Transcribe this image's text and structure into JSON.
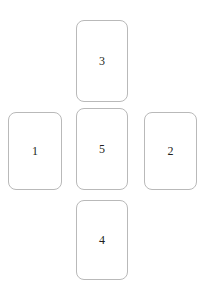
{
  "diagram": {
    "type": "card-spread",
    "layout": "cross",
    "background_color": "#ffffff",
    "card": {
      "fill_color": "#ffffff",
      "border_color": "#b9b9b9",
      "border_radius_px": 8,
      "number_color": "#231f20"
    },
    "cards": [
      {
        "label": "3",
        "position": "top",
        "x": 76,
        "y": 20,
        "width": 52,
        "height": 82
      },
      {
        "label": "1",
        "position": "left",
        "x": 8,
        "y": 112,
        "width": 54,
        "height": 78
      },
      {
        "label": "5",
        "position": "center",
        "x": 76,
        "y": 108,
        "width": 52,
        "height": 82
      },
      {
        "label": "2",
        "position": "right",
        "x": 144,
        "y": 112,
        "width": 53,
        "height": 78
      },
      {
        "label": "4",
        "position": "bottom",
        "x": 76,
        "y": 200,
        "width": 52,
        "height": 80
      }
    ]
  }
}
